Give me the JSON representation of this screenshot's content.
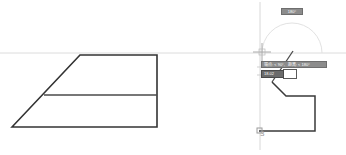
{
  "app": {
    "title": "CAD Drawing Area",
    "background_color": "#ffffff",
    "geometry_color": "#333333",
    "construction_color": "#d6d6d6",
    "tooltip_bg": "#8c8c8c",
    "tooltip_text_color": "#ffffff",
    "label_color": "#9a9a9a"
  },
  "left_figure": {
    "name": "trapezoid-with-median",
    "outline_points": "12,127 80,55 157,55 157,127 12,127",
    "median_line": {
      "x1": 44,
      "y1": 95,
      "x2": 157,
      "y2": 95
    }
  },
  "right_figure": {
    "name": "polyline-in-progress",
    "path_points": "272,82 286,96 315,96 315,131 259,131",
    "rubber_band": {
      "x1": 272,
      "y1": 82,
      "x2": 285,
      "y2": 63
    },
    "cursor_pick_line": {
      "x1": 285,
      "y1": 63,
      "x2": 292,
      "y2": 52
    }
  },
  "construction": {
    "horizontal_line_y": 53,
    "vertical_axis_x": 260,
    "snap_arc": {
      "center_x": 292,
      "center_y": 53,
      "radius": 30,
      "description": "angle-snap-semicircle"
    },
    "crosshair": {
      "x": 262,
      "y": 52,
      "size": 9
    }
  },
  "overlays": {
    "angle_badge": "180°",
    "hint_prefix": "端点: < 90°,",
    "hint_suffix": "距离: < 180°",
    "entry_value": "18.02",
    "origin_label": "3"
  },
  "icons": {
    "crosshair": "crosshair-icon",
    "origin_node": "origin-node-icon",
    "snap_marker": "snap-marker-icon"
  }
}
